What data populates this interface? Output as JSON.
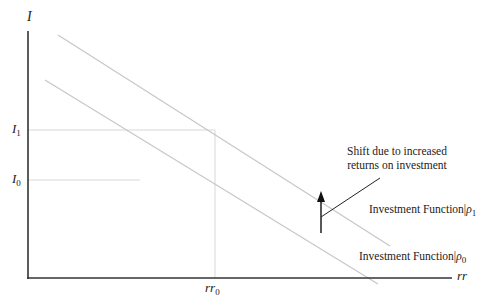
{
  "diagram": {
    "type": "investment-function-shift",
    "axes": {
      "y_label": "I",
      "x_label": "rr"
    },
    "ticks": {
      "y": [
        {
          "base": "I",
          "sub": "1"
        },
        {
          "base": "I",
          "sub": "0"
        }
      ],
      "x": [
        {
          "base": "rr",
          "sub": "0"
        }
      ]
    },
    "curves": [
      {
        "name": "Investment Function|",
        "param": "ρ",
        "sub": "1",
        "position": "upper"
      },
      {
        "name": "Investment Function|",
        "param": "ρ",
        "sub": "0",
        "position": "lower"
      }
    ],
    "annotation": {
      "line1": "Shift due to increased",
      "line2": "returns on investment"
    },
    "colors": {
      "axis": "#333333",
      "curve": "#c8c8c8",
      "guide": "#d8d8d8",
      "arrow": "#111111"
    }
  }
}
